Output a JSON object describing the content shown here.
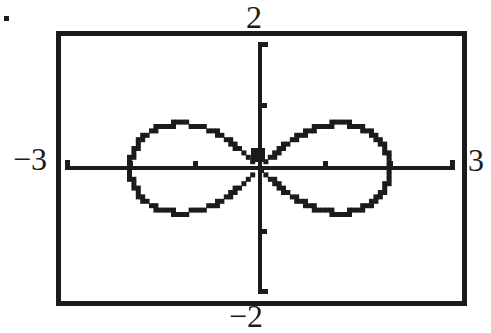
{
  "page": {
    "background": "#ffffff",
    "ink": "#1b1b1b",
    "stray_period_mark": "."
  },
  "chart_data": {
    "type": "line",
    "chart_kind": "graphing-calculator polar curve plot",
    "title": "",
    "curve": {
      "name": "lemniscate",
      "equation": "r^2 = 4 cos(2θ)",
      "a": 2
    },
    "window": {
      "xmin": -3,
      "xmax": 3,
      "xscl": 1,
      "ymin": -2,
      "ymax": 2,
      "yscl": 1
    },
    "axis_edge_labels": {
      "top": "2",
      "bottom": "−2",
      "left": "−3",
      "right": "3"
    },
    "grid": false,
    "axes": {
      "x_ticks": [
        -2,
        -1,
        1,
        2
      ],
      "y_ticks": [
        -1,
        1
      ],
      "end_caps": true
    },
    "origin_cursor_blob": true,
    "series": [
      {
        "name": "right loop",
        "points": [
          [
            0,
            0
          ],
          [
            0.64,
            0.54
          ],
          [
            1.22,
            0.71
          ],
          [
            1.65,
            0.6
          ],
          [
            1.91,
            0.34
          ],
          [
            2.0,
            0
          ],
          [
            1.91,
            -0.34
          ],
          [
            1.65,
            -0.6
          ],
          [
            1.22,
            -0.71
          ],
          [
            0.64,
            -0.54
          ],
          [
            0,
            0
          ]
        ]
      },
      {
        "name": "left loop",
        "points": [
          [
            0,
            0
          ],
          [
            -0.64,
            0.54
          ],
          [
            -1.22,
            0.71
          ],
          [
            -1.65,
            0.6
          ],
          [
            -1.91,
            0.34
          ],
          [
            -2.0,
            0
          ],
          [
            -1.91,
            -0.34
          ],
          [
            -1.65,
            -0.6
          ],
          [
            -1.22,
            -0.71
          ],
          [
            -0.64,
            -0.54
          ],
          [
            0,
            0
          ]
        ]
      }
    ]
  }
}
